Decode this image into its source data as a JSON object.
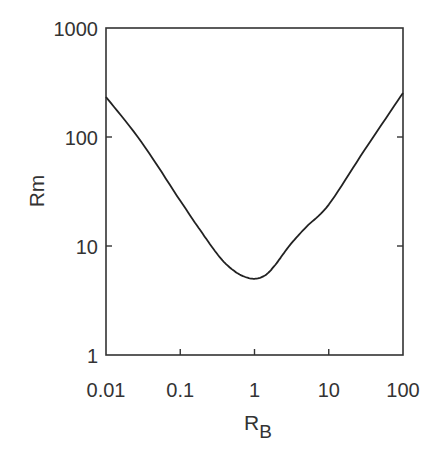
{
  "chart_data": {
    "type": "line",
    "title": "",
    "xlabel": "R",
    "xlabel_subscript": "B",
    "ylabel": "Rm",
    "xscale": "log",
    "yscale": "log",
    "xlim": [
      0.01,
      100
    ],
    "ylim": [
      1,
      1000
    ],
    "grid": false,
    "legend": null,
    "x_ticks": [
      0.01,
      0.1,
      1,
      10,
      100
    ],
    "x_tick_labels": [
      "0.01",
      "0.1",
      "1",
      "10",
      "100"
    ],
    "y_ticks": [
      1,
      10,
      100,
      1000
    ],
    "y_tick_labels": [
      "1",
      "10",
      "100",
      "1000"
    ],
    "series": [
      {
        "name": "Rm",
        "color": "#222222",
        "x": [
          0.01,
          0.03,
          0.1,
          0.2,
          0.34,
          0.5,
          0.7,
          1.0,
          1.4,
          1.9,
          3.0,
          5.0,
          10,
          30,
          100
        ],
        "y": [
          233,
          90,
          26,
          13,
          7.9,
          6.1,
          5.3,
          5.0,
          5.4,
          6.7,
          10.2,
          15,
          24,
          75,
          254
        ]
      }
    ]
  }
}
